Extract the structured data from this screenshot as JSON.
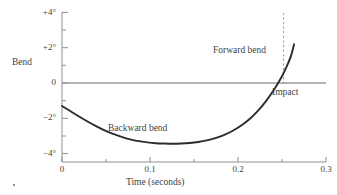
{
  "chart_data": {
    "type": "line",
    "title": "",
    "xlabel": "Time (seconds)",
    "ylabel": "Bend",
    "xlim": [
      0,
      0.31
    ],
    "ylim": [
      -4,
      4.4
    ],
    "grid": false,
    "legend": null,
    "x_ticks": [
      {
        "value": 0,
        "label": "0",
        "major": true
      },
      {
        "value": 0.05,
        "label": "",
        "major": false
      },
      {
        "value": 0.1,
        "label": "0.1",
        "major": true
      },
      {
        "value": 0.15,
        "label": "",
        "major": false
      },
      {
        "value": 0.2,
        "label": "0.2",
        "major": true
      },
      {
        "value": 0.25,
        "label": "",
        "major": false
      },
      {
        "value": 0.3,
        "label": "0.3",
        "major": true
      }
    ],
    "y_ticks": [
      {
        "value": 4,
        "label": "+4°",
        "major": true
      },
      {
        "value": 3,
        "label": "",
        "major": false
      },
      {
        "value": 2,
        "label": "+2°",
        "major": true
      },
      {
        "value": 1,
        "label": "",
        "major": false
      },
      {
        "value": 0,
        "label": "0",
        "major": true
      },
      {
        "value": -1,
        "label": "",
        "major": false
      },
      {
        "value": -2,
        "label": "−2°",
        "major": true
      },
      {
        "value": -3,
        "label": "",
        "major": false
      },
      {
        "value": -4,
        "label": "−4°",
        "major": true
      }
    ],
    "series": [
      {
        "name": "Bend",
        "color": "#2b2b2b",
        "points": [
          [
            0.0,
            -1.3
          ],
          [
            0.01,
            -1.6
          ],
          [
            0.02,
            -1.9
          ],
          [
            0.03,
            -2.18
          ],
          [
            0.04,
            -2.44
          ],
          [
            0.05,
            -2.68
          ],
          [
            0.06,
            -2.88
          ],
          [
            0.07,
            -3.05
          ],
          [
            0.08,
            -3.19
          ],
          [
            0.09,
            -3.29
          ],
          [
            0.1,
            -3.36
          ],
          [
            0.11,
            -3.41
          ],
          [
            0.12,
            -3.43
          ],
          [
            0.13,
            -3.44
          ],
          [
            0.14,
            -3.43
          ],
          [
            0.15,
            -3.4
          ],
          [
            0.16,
            -3.34
          ],
          [
            0.17,
            -3.25
          ],
          [
            0.18,
            -3.12
          ],
          [
            0.19,
            -2.95
          ],
          [
            0.2,
            -2.72
          ],
          [
            0.21,
            -2.42
          ],
          [
            0.22,
            -2.05
          ],
          [
            0.23,
            -1.58
          ],
          [
            0.24,
            -1.0
          ],
          [
            0.25,
            -0.3
          ],
          [
            0.258,
            0.35
          ],
          [
            0.264,
            0.95
          ],
          [
            0.269,
            1.55
          ],
          [
            0.2725,
            2.2
          ]
        ]
      }
    ],
    "reference_lines": [
      {
        "name": "zero-line",
        "orientation": "horizontal",
        "value": 0,
        "style": "solid",
        "color": "#8f8f8f"
      },
      {
        "name": "impact-line",
        "orientation": "vertical",
        "value": 0.2755,
        "style": "dashed",
        "color": "#8f8f8f",
        "y_from": -0.1,
        "y_to": 4.4
      }
    ],
    "annotations": [
      {
        "name": "forward-bend",
        "text": "Forward bend"
      },
      {
        "name": "backward-bend",
        "text": "Backward bend"
      },
      {
        "name": "impact",
        "text": "Impact"
      }
    ],
    "colors": {
      "curve": "#2b2b2b",
      "axis": "#8f8f8f",
      "text": "#3f3f3f",
      "background": "#ffffff"
    }
  },
  "axis_titles": {
    "y": "Bend",
    "x": "Time (seconds)"
  },
  "annotations": {
    "forward_bend": "Forward bend",
    "backward_bend": "Backward bend",
    "impact": "Impact"
  },
  "y_tick_labels": {
    "plus4": "+4°",
    "plus2": "+2°",
    "zero": "0",
    "minus2": "−2°",
    "minus4": "−4°"
  },
  "x_tick_labels": {
    "t0": "0",
    "t01": "0.1",
    "t02": "0.2",
    "t03": "0.3"
  }
}
